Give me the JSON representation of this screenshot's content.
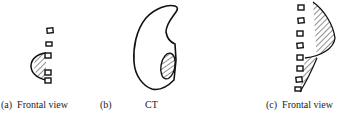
{
  "figure": {
    "panels": [
      {
        "id": "a",
        "label": "(a)",
        "caption": "Frontal view",
        "content": "vertebrae column with hatched half-disc lesion on left side"
      },
      {
        "id": "b",
        "label": "(b)",
        "caption": "CT",
        "content": "cross-sectional outline with hatched oval lesion"
      },
      {
        "id": "c",
        "label": "(c)",
        "caption": "Frontal view",
        "content": "vertebrae column with large hatched lesion on right side"
      }
    ],
    "colors": {
      "stroke": "#111111",
      "background": "#ffffff"
    }
  }
}
